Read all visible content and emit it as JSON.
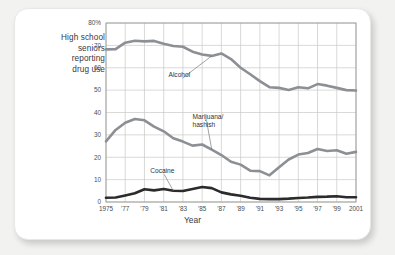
{
  "chart_data": {
    "type": "line",
    "title": "",
    "ylabel": "High school\nseniors\nreporting\ndrug use",
    "ylabel_lines": [
      "High school",
      "seniors",
      "reporting",
      "drug use"
    ],
    "xlabel": "Year",
    "ylim": [
      0,
      80
    ],
    "xlim": [
      1975,
      2001
    ],
    "yticks": [
      0,
      10,
      20,
      30,
      40,
      50,
      60,
      70,
      80
    ],
    "ytick_labels": [
      "0",
      "10",
      "20",
      "30",
      "40",
      "50",
      "60",
      "70",
      "80%"
    ],
    "xticks": [
      1975,
      1977,
      1979,
      1981,
      1983,
      1985,
      1987,
      1989,
      1991,
      1993,
      1995,
      1997,
      1999,
      2001
    ],
    "xtick_labels": [
      "1975",
      "'77",
      "'79",
      "'81",
      "'83",
      "'85",
      "'87",
      "'89",
      "'91",
      "'93",
      "'95",
      "'97",
      "'99",
      "2001"
    ],
    "grid": true,
    "legend": "inline-annotations",
    "x": [
      1975,
      1976,
      1977,
      1978,
      1979,
      1980,
      1981,
      1982,
      1983,
      1984,
      1985,
      1986,
      1987,
      1988,
      1989,
      1990,
      1991,
      1992,
      1993,
      1994,
      1995,
      1996,
      1997,
      1998,
      1999,
      2000,
      2001
    ],
    "series": [
      {
        "name": "Alcohol",
        "color": "#8c9095",
        "label": "Alcohol",
        "values": [
          68.2,
          68.3,
          71.2,
          72.1,
          71.8,
          72.0,
          70.7,
          69.7,
          69.4,
          67.2,
          65.9,
          65.3,
          66.4,
          63.9,
          60.0,
          57.1,
          54.0,
          51.3,
          51.0,
          50.1,
          51.3,
          50.8,
          52.7,
          52.0,
          51.0,
          50.0,
          49.8
        ]
      },
      {
        "name": "Marijuana/hashish",
        "color": "#8c9095",
        "label_lines": [
          "Marijuana/",
          "hashish"
        ],
        "values": [
          27.1,
          32.2,
          35.4,
          37.1,
          36.5,
          33.7,
          31.6,
          28.5,
          27.0,
          25.2,
          25.7,
          23.4,
          21.0,
          18.0,
          16.7,
          14.0,
          13.8,
          11.9,
          15.5,
          19.0,
          21.2,
          21.9,
          23.7,
          22.8,
          23.1,
          21.6,
          22.4
        ]
      },
      {
        "name": "Cocaine",
        "color": "#2b2b2b",
        "label": "Cocaine",
        "values": [
          1.9,
          2.0,
          2.9,
          3.9,
          5.7,
          5.2,
          5.8,
          5.0,
          4.9,
          5.8,
          6.7,
          6.2,
          4.3,
          3.4,
          2.8,
          1.9,
          1.4,
          1.3,
          1.3,
          1.5,
          1.8,
          2.0,
          2.3,
          2.4,
          2.6,
          2.1,
          2.1
        ]
      }
    ],
    "annotations": [
      {
        "text": "Alcohol",
        "at_year": 1986,
        "label_x": 1981.5,
        "label_y": 56
      },
      {
        "text": "Marijuana/hashish",
        "at_year": 1986,
        "label_x": 1984.0,
        "label_y": 37
      },
      {
        "text": "Cocaine",
        "at_year": 1982,
        "label_x": 1979.6,
        "label_y": 13
      }
    ]
  },
  "colors": {
    "page_background": "#f2f2f0",
    "card_background": "#ffffff",
    "grid": "#c8c8c6",
    "axis": "#9a9a98",
    "text": "#35393d",
    "alcohol": "#8c9095",
    "marijuana": "#8c9095",
    "cocaine": "#2b2b2b"
  }
}
